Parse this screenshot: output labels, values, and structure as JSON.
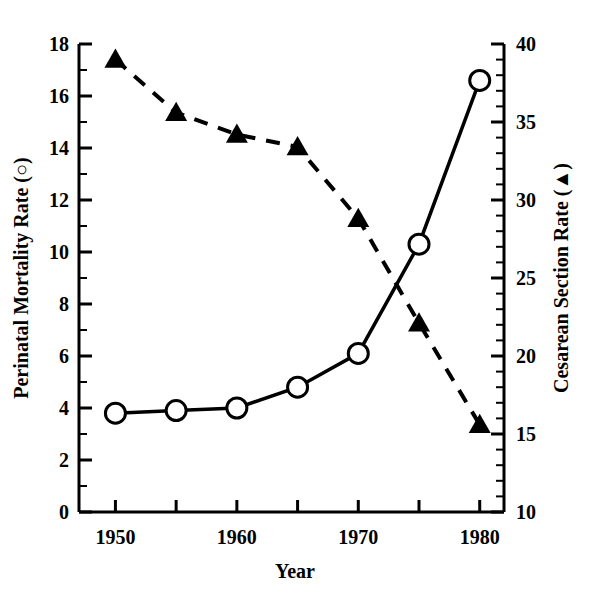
{
  "chart_data": {
    "type": "line",
    "title": "",
    "xlabel": "Year",
    "ylabel_left": "Perinatal Mortality Rate (○)",
    "ylabel_right": "Cesarean Section Rate (▲)",
    "x": [
      1950,
      1955,
      1960,
      1965,
      1970,
      1975,
      1980
    ],
    "xlim": [
      1947,
      1982
    ],
    "xticks_major": [
      1950,
      1960,
      1970,
      1980
    ],
    "xticks_major_labels": [
      "1950",
      "1960",
      "1970",
      "1980"
    ],
    "xticks_minor": [
      1955,
      1965,
      1975
    ],
    "ylim_left": [
      0,
      18
    ],
    "yticks_left": [
      0,
      2,
      4,
      6,
      8,
      10,
      12,
      14,
      16,
      18
    ],
    "yticks_left_labels": [
      "0",
      "2",
      "4",
      "6",
      "8",
      "10",
      "12",
      "14",
      "16",
      "18"
    ],
    "ylim_right": [
      10,
      40
    ],
    "yticks_right": [
      10,
      15,
      20,
      25,
      30,
      35,
      40
    ],
    "yticks_right_labels": [
      "10",
      "15",
      "20",
      "25",
      "30",
      "35",
      "40"
    ],
    "grid": false,
    "legend_position": "none",
    "series": [
      {
        "name": "Perinatal Mortality Rate",
        "axis": "left",
        "marker": "open-circle",
        "linestyle": "solid",
        "color": "#000000",
        "values": [
          3.8,
          3.9,
          4.0,
          4.8,
          6.1,
          10.3,
          16.6
        ]
      },
      {
        "name": "Cesarean Section Rate",
        "axis": "right",
        "marker": "filled-triangle",
        "linestyle": "dashed",
        "color": "#000000",
        "values": [
          39.0,
          35.6,
          34.2,
          33.4,
          28.8,
          22.1,
          15.6
        ]
      }
    ]
  },
  "colors": {
    "ink": "#000000",
    "background": "#ffffff"
  }
}
